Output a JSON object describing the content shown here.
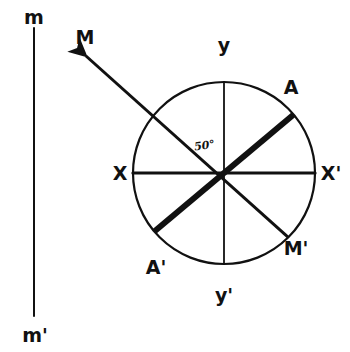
{
  "figure": {
    "ink_color": "#111111",
    "background_color": "#ffffff"
  },
  "reference_line": {
    "name": "vertical-reference-line",
    "top_label": "m",
    "bottom_label": "m'",
    "x": 34,
    "y_top": 28,
    "y_bottom": 316,
    "stroke_width": 2
  },
  "circle": {
    "name": "unit-circle",
    "center_x": 224,
    "center_y": 173,
    "radius": 91,
    "stroke_width": 2.2
  },
  "axes": [
    {
      "name": "horizontal-axis",
      "left_label": "X",
      "right_label": "X'",
      "angle_deg": 0,
      "stroke_width": 3
    },
    {
      "name": "vertical-axis",
      "top_label": "y",
      "bottom_label": "y'",
      "angle_deg": 90,
      "stroke_width": 1.7
    }
  ],
  "vectors": [
    {
      "name": "chord-A-Aprime",
      "head_label": "A",
      "tail_label": "A'",
      "angle_deg": 40,
      "stroke_width": 6,
      "style": "thick",
      "arrow": false
    },
    {
      "name": "ray-M-Mprime",
      "head_label": "M",
      "tail_label": "M'",
      "angle_deg": 135,
      "stroke_width": 3,
      "style": "thin",
      "arrow": true,
      "arrow_extends_beyond_circle": true
    }
  ],
  "angle_annotation": {
    "name": "angle-between-M-and-A",
    "value": "50",
    "unit": "°",
    "text": "50°",
    "between": [
      "ray-M-Mprime",
      "chord-A-Aprime"
    ]
  },
  "labels": {
    "m": "m",
    "m_prime": "m'",
    "y": "y",
    "y_prime": "y'",
    "x": "X",
    "x_prime": "X'",
    "a": "A",
    "a_prime": "A'",
    "big_m": "M",
    "big_m_prime": "M'",
    "angle": "50°"
  }
}
